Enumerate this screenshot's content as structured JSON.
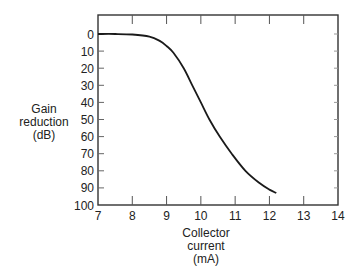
{
  "chart_data": {
    "type": "line",
    "title": "",
    "xlabel": "Collector current (mA)",
    "xlabel_lines": [
      "Collector",
      "current",
      "(mA)"
    ],
    "ylabel": "Gain reduction (dB)",
    "ylabel_lines": [
      "Gain",
      "reduction",
      "(dB)"
    ],
    "xlim": [
      7,
      14
    ],
    "ylim": [
      0,
      100
    ],
    "y_inverted": true,
    "x_ticks": [
      7,
      8,
      9,
      10,
      11,
      12,
      13,
      14
    ],
    "y_ticks": [
      0,
      10,
      20,
      30,
      40,
      50,
      60,
      70,
      80,
      90,
      100
    ],
    "grid": false,
    "legend": null,
    "series": [
      {
        "name": "Gain reduction",
        "x": [
          7.0,
          7.5,
          8.0,
          8.5,
          8.8,
          9.0,
          9.2,
          9.5,
          9.75,
          10.0,
          10.25,
          10.55,
          10.9,
          11.3,
          11.7,
          12.0,
          12.2
        ],
        "y": [
          0,
          0,
          0.3,
          1.5,
          4,
          7,
          11,
          20,
          30,
          40,
          50,
          60,
          70,
          80,
          87,
          91,
          93
        ]
      }
    ]
  }
}
